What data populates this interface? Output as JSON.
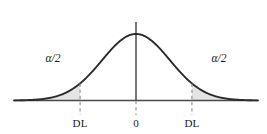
{
  "figure": {
    "background_color": "#ffffff",
    "curve_color": "#2b2b2b",
    "axis_color": "#4a4a4a",
    "dashed_color": "#8c8c8c",
    "shade_color": "#e4e4e4",
    "text_color": "#1a1a1a"
  },
  "labels": {
    "alpha_left": "α/2",
    "alpha_right": "α/2",
    "tick_left": "DL",
    "tick_center": "0",
    "tick_right": "DL"
  },
  "chart_data": {
    "type": "area",
    "title": "",
    "subtitle": "",
    "xlabel": "",
    "ylabel": "",
    "grid": false,
    "legend": null,
    "distribution": "normal",
    "mean": 0,
    "std_dev": 1,
    "xlim": [
      -3.6,
      3.6
    ],
    "ylim": [
      0,
      1.18
    ],
    "baseline_y": 0,
    "peak_value": 1.0,
    "annotations": [
      {
        "name": "alpha-left",
        "text": "α/2",
        "x": -2.45,
        "y": 0.58,
        "region": "left-tail"
      },
      {
        "name": "alpha-right",
        "text": "α/2",
        "x": 2.45,
        "y": 0.58,
        "region": "right-tail"
      }
    ],
    "tick_marks": [
      {
        "label": "DL",
        "x": -1.65,
        "dashed": true
      },
      {
        "label": "0",
        "x": 0,
        "dashed": true
      },
      {
        "label": "DL",
        "x": 1.65,
        "dashed": true
      }
    ],
    "shaded_regions": [
      {
        "name": "left-critical-region",
        "from": -3.6,
        "to": -1.65,
        "color": "#e4e4e4"
      },
      {
        "name": "right-critical-region",
        "from": 1.65,
        "to": 3.6,
        "color": "#e4e4e4"
      }
    ],
    "center_axis": {
      "x": 0,
      "from_y": 0,
      "to_y": 1.18
    },
    "x": [
      -3.6,
      -3.4,
      -3.2,
      -3.0,
      -2.8,
      -2.6,
      -2.4,
      -2.2,
      -2.0,
      -1.8,
      -1.65,
      -1.4,
      -1.2,
      -1.0,
      -0.8,
      -0.6,
      -0.4,
      -0.2,
      0.0,
      0.2,
      0.4,
      0.6,
      0.8,
      1.0,
      1.2,
      1.4,
      1.65,
      1.8,
      2.0,
      2.2,
      2.4,
      2.6,
      2.8,
      3.0,
      3.2,
      3.4,
      3.6
    ],
    "values": [
      0.0017,
      0.0034,
      0.0063,
      0.0111,
      0.0198,
      0.034,
      0.0561,
      0.0889,
      0.1353,
      0.1979,
      0.2575,
      0.3753,
      0.4868,
      0.6065,
      0.7261,
      0.8353,
      0.9231,
      0.9802,
      1.0,
      0.9802,
      0.9231,
      0.8353,
      0.7261,
      0.6065,
      0.4868,
      0.3753,
      0.2575,
      0.1979,
      0.1353,
      0.0889,
      0.0561,
      0.034,
      0.0198,
      0.0111,
      0.0063,
      0.0034,
      0.0017
    ]
  }
}
